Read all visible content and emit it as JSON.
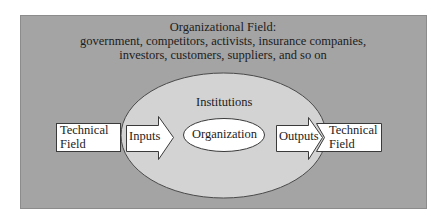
{
  "diagram": {
    "colors": {
      "page_background": "#ffffff",
      "field_background": "#a4a4a4",
      "field_border": "#8c8c8c",
      "institutions_fill": "#d3d3d3",
      "institutions_stroke": "#4a4a4a",
      "box_fill": "#ffffff",
      "box_stroke": "#3a3a3a",
      "text": "#1c1c1c"
    },
    "organizational_field": {
      "title": "Organizational Field:",
      "line2": "government, competitors, activists, insurance companies,",
      "line3": "investors, customers, suppliers, and so on"
    },
    "institutions": {
      "label": "Institutions"
    },
    "organization": {
      "label": "Organization"
    },
    "technical_field_left": {
      "line1": "Technical",
      "line2": "Field"
    },
    "inputs_arrow": {
      "label": "Inputs"
    },
    "outputs_arrow": {
      "label": "Outputs"
    },
    "technical_field_right": {
      "line1": "Technical",
      "line2": "Field"
    }
  }
}
